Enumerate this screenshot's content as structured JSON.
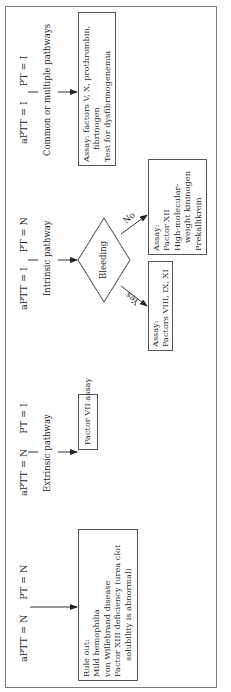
{
  "diagram": {
    "type": "flowchart",
    "orientation": "rotated-90-ccw",
    "columns": [
      {
        "aptt": "aPTT = N",
        "pt": "PT = N",
        "pathway": "",
        "result_box": {
          "lines": [
            "Rule out:",
            "Mild hemophilia",
            "von Willebrand disease",
            "Factor XIII deficiency (urea clot",
            "solubility is abnormal)"
          ]
        }
      },
      {
        "aptt": "aPTT = N",
        "pt": "PT = I",
        "pathway": "Extrinsic pathway",
        "result_box": {
          "lines": [
            "Factor VII assay"
          ]
        }
      },
      {
        "aptt": "aPTT = I",
        "pt": "PT = N",
        "pathway": "Intrinsic pathway",
        "decision": {
          "label": "Bleeding",
          "yes_label": "Yes",
          "no_label": "No",
          "yes_box": {
            "lines": [
              "Assay:",
              "Factors VIII, IX, XI"
            ]
          },
          "no_box": {
            "lines": [
              "Assay:",
              "Factor XII",
              "High-molecular-",
              "weight kininogen",
              "Prekallikrein"
            ]
          }
        }
      },
      {
        "aptt": "aPTT = I",
        "pt": "PT = I",
        "pathway": "Common or multiple pathways",
        "result_box": {
          "lines": [
            "Assay: factors V, X, prothrombin,",
            "fibrinogen",
            "Test for dysfibrinogenemia"
          ]
        }
      }
    ]
  }
}
